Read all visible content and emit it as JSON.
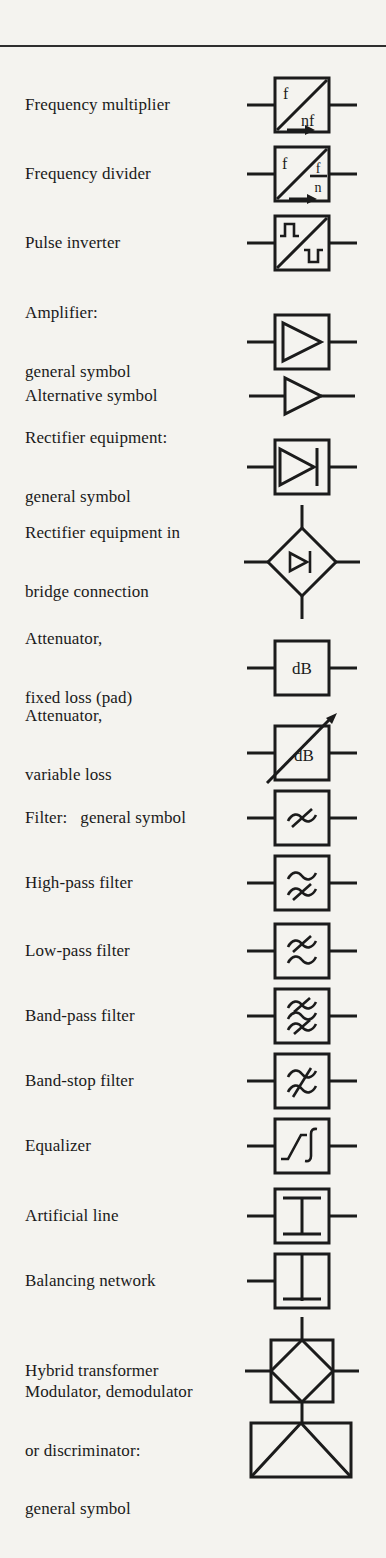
{
  "page": {
    "background": "#f4f3ef",
    "ink": "#1b1b1b"
  },
  "rows": [
    {
      "id": "frequency-multiplier",
      "lines": [
        "Frequency multiplier"
      ],
      "sym": {
        "input": "f",
        "output": "nf"
      }
    },
    {
      "id": "frequency-divider",
      "lines": [
        "Frequency divider"
      ],
      "sym": {
        "input": "f",
        "numerator": "f",
        "denominator": "n"
      }
    },
    {
      "id": "pulse-inverter",
      "lines": [
        "Pulse inverter"
      ]
    },
    {
      "id": "amplifier-general",
      "lines": [
        "Amplifier:",
        "general symbol"
      ]
    },
    {
      "id": "amplifier-alternative",
      "lines": [
        "Alternative symbol"
      ]
    },
    {
      "id": "rectifier-general",
      "lines": [
        "Rectifier equipment:",
        "general symbol"
      ]
    },
    {
      "id": "rectifier-bridge",
      "lines": [
        "Rectifier equipment in",
        "bridge connection"
      ]
    },
    {
      "id": "attenuator-fixed",
      "lines": [
        "Attenuator,",
        "fixed loss (pad)"
      ],
      "sym": {
        "unit": "dB"
      }
    },
    {
      "id": "attenuator-variable",
      "lines": [
        "Attenuator,",
        "variable loss"
      ],
      "sym": {
        "unit": "dB"
      }
    },
    {
      "id": "filter-general",
      "lines": [
        "Filter:   general symbol"
      ]
    },
    {
      "id": "high-pass-filter",
      "lines": [
        "High-pass filter"
      ]
    },
    {
      "id": "low-pass-filter",
      "lines": [
        "Low-pass filter"
      ]
    },
    {
      "id": "band-pass-filter",
      "lines": [
        "Band-pass filter"
      ]
    },
    {
      "id": "band-stop-filter",
      "lines": [
        "Band-stop filter"
      ]
    },
    {
      "id": "equalizer",
      "lines": [
        "Equalizer"
      ]
    },
    {
      "id": "artificial-line",
      "lines": [
        "Artificial line"
      ]
    },
    {
      "id": "balancing-network",
      "lines": [
        "Balancing network"
      ]
    },
    {
      "id": "hybrid-transformer",
      "lines": [
        "Hybrid transformer"
      ]
    },
    {
      "id": "modulator-demodulator",
      "lines": [
        "Modulator, demodulator",
        "or discriminator:",
        "general symbol"
      ]
    }
  ]
}
